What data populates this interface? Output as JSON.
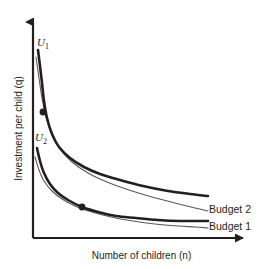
{
  "figure": {
    "background": "#ffffff",
    "ink": "#231f20"
  },
  "axes": {
    "y_label": "Investment per child (q)",
    "x_label": "Number of children (n)",
    "origin_px": [
      33,
      238
    ],
    "y_axis_top_px": [
      33,
      14
    ],
    "x_axis_right_px": [
      250,
      238
    ],
    "arrowheads": [
      "y-axis-top",
      "x-axis-right"
    ],
    "ticks": [],
    "grid": false
  },
  "labels": {
    "u1": "U",
    "u1_sub": "1",
    "u2": "U",
    "u2_sub": "2",
    "budget2": "Budget 2",
    "budget1": "Budget 1"
  },
  "chart_data": {
    "type": "line",
    "title": "",
    "xlabel": "Number of children (n)",
    "ylabel": "Investment per child (q)",
    "xlim": [
      0,
      1
    ],
    "ylim": [
      0,
      1
    ],
    "grid": false,
    "legend_position": "right-inline",
    "series": [
      {
        "name": "U1",
        "role": "indifference-curve",
        "style": "thick",
        "stroke": "#231f20",
        "width": 2.6,
        "label": "U1",
        "points_px": [
          [
            38,
            50
          ],
          [
            40,
            66
          ],
          [
            42,
            83
          ],
          [
            44,
            101
          ],
          [
            47,
            118
          ],
          [
            52,
            134
          ],
          [
            59,
            147
          ],
          [
            70,
            158
          ],
          [
            84,
            167
          ],
          [
            100,
            174
          ],
          [
            120,
            180
          ],
          [
            143,
            186
          ],
          [
            168,
            191
          ],
          [
            190,
            194
          ],
          [
            208,
            196
          ]
        ]
      },
      {
        "name": "Budget 2",
        "role": "budget-constraint",
        "style": "thin",
        "stroke": "#58585b",
        "width": 1.1,
        "label": "Budget 2",
        "points_px": [
          [
            36,
            57
          ],
          [
            39,
            78
          ],
          [
            42,
            98
          ],
          [
            46,
            117
          ],
          [
            52,
            134
          ],
          [
            60,
            149
          ],
          [
            72,
            162
          ],
          [
            88,
            173
          ],
          [
            107,
            182
          ],
          [
            129,
            190
          ],
          [
            152,
            197
          ],
          [
            175,
            203
          ],
          [
            195,
            208
          ],
          [
            208,
            211
          ]
        ]
      },
      {
        "name": "U2",
        "role": "indifference-curve",
        "style": "thick",
        "stroke": "#231f20",
        "width": 2.6,
        "label": "U2",
        "points_px": [
          [
            37,
            148
          ],
          [
            40,
            161
          ],
          [
            44,
            173
          ],
          [
            50,
            184
          ],
          [
            58,
            193
          ],
          [
            68,
            200
          ],
          [
            82,
            207
          ],
          [
            98,
            212
          ],
          [
            116,
            216
          ],
          [
            136,
            218
          ],
          [
            158,
            220
          ],
          [
            180,
            221
          ],
          [
            208,
            221
          ]
        ]
      },
      {
        "name": "Budget 1",
        "role": "budget-constraint",
        "style": "thin",
        "stroke": "#58585b",
        "width": 1.1,
        "label": "Budget 1",
        "points_px": [
          [
            35,
            157
          ],
          [
            39,
            170
          ],
          [
            44,
            181
          ],
          [
            52,
            191
          ],
          [
            62,
            199
          ],
          [
            75,
            206
          ],
          [
            92,
            212
          ],
          [
            111,
            217
          ],
          [
            133,
            221
          ],
          [
            155,
            224
          ],
          [
            178,
            226
          ],
          [
            195,
            227
          ],
          [
            208,
            228
          ]
        ]
      }
    ],
    "annotations": [
      {
        "name": "tangency-point-u1",
        "type": "point",
        "marker": "filled-circle",
        "radius_px": 3.4,
        "position_px": [
          43,
          112
        ],
        "description": "Tangency of U1 with Budget 2"
      },
      {
        "name": "tangency-point-u2",
        "type": "point",
        "marker": "filled-circle",
        "radius_px": 3.4,
        "position_px": [
          82,
          207
        ],
        "description": "Tangency of U2 with Budget 1"
      }
    ]
  }
}
